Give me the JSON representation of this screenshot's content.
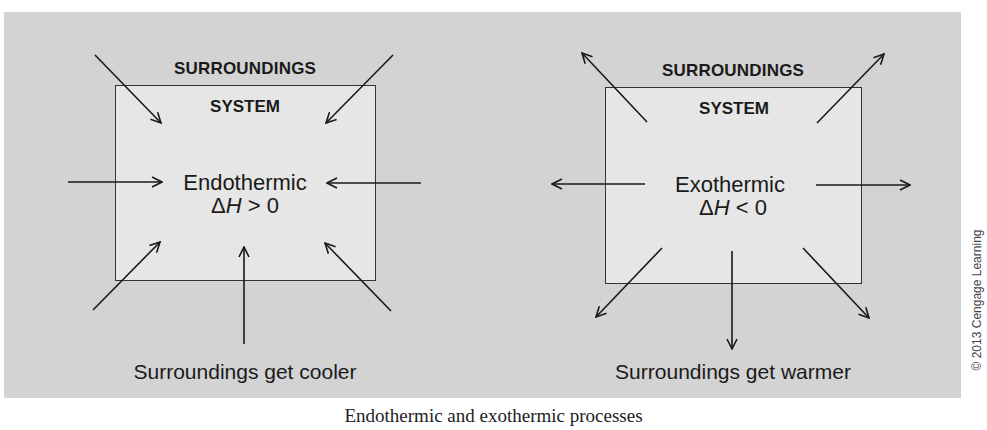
{
  "panels": [
    {
      "surroundings_label": "SURROUNDINGS",
      "system_label": "SYSTEM",
      "process_label": "Endothermic",
      "delta_h_symbol": "ΔH",
      "delta_h_relation": " > 0",
      "bottom_label": "Surroundings get cooler",
      "arrow_direction": "inward"
    },
    {
      "surroundings_label": "SURROUNDINGS",
      "system_label": "SYSTEM",
      "process_label": "Exothermic",
      "delta_h_symbol": "ΔH",
      "delta_h_relation": " < 0",
      "bottom_label": "Surroundings get warmer",
      "arrow_direction": "outward"
    }
  ],
  "caption": "Endothermic and exothermic processes",
  "copyright": "© 2013 Cengage Learning",
  "colors": {
    "panel_background": "#d3d3d3",
    "system_box": "#e6e6e6",
    "line": "#1a1a1a"
  }
}
